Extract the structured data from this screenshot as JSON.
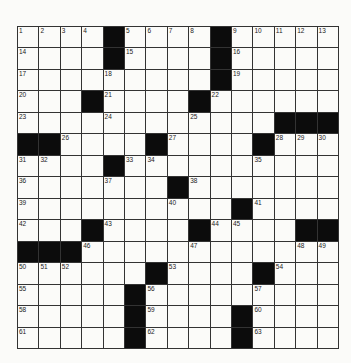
{
  "puzzle": {
    "rows": 15,
    "cols": 15,
    "colors": {
      "black": "#0c0c0c",
      "white": "#fbfbf9",
      "line": "#333333"
    },
    "layout": [
      "....#....#.....",
      "....#....#.....",
      ".........#.....",
      "...#....#......",
      "............###",
      "##....#....#...",
      "....#..........",
      ".......#.......",
      "..........#....",
      "...#....#....##",
      "###............",
      "......#....#...",
      ".....#.........",
      ".....#....#....",
      ".....#....#...."
    ],
    "numbers": [
      {
        "r": 0,
        "c": 0,
        "n": "1"
      },
      {
        "r": 0,
        "c": 1,
        "n": "2"
      },
      {
        "r": 0,
        "c": 2,
        "n": "3"
      },
      {
        "r": 0,
        "c": 3,
        "n": "4"
      },
      {
        "r": 0,
        "c": 5,
        "n": "5"
      },
      {
        "r": 0,
        "c": 6,
        "n": "6"
      },
      {
        "r": 0,
        "c": 7,
        "n": "7"
      },
      {
        "r": 0,
        "c": 8,
        "n": "8"
      },
      {
        "r": 0,
        "c": 10,
        "n": "9"
      },
      {
        "r": 0,
        "c": 11,
        "n": "10"
      },
      {
        "r": 0,
        "c": 12,
        "n": "11"
      },
      {
        "r": 0,
        "c": 13,
        "n": "12"
      },
      {
        "r": 0,
        "c": 14,
        "n": "13"
      },
      {
        "r": 1,
        "c": 0,
        "n": "14"
      },
      {
        "r": 1,
        "c": 5,
        "n": "15"
      },
      {
        "r": 1,
        "c": 10,
        "n": "16"
      },
      {
        "r": 2,
        "c": 0,
        "n": "17"
      },
      {
        "r": 2,
        "c": 4,
        "n": "18"
      },
      {
        "r": 2,
        "c": 10,
        "n": "19"
      },
      {
        "r": 3,
        "c": 0,
        "n": "20"
      },
      {
        "r": 3,
        "c": 4,
        "n": "21"
      },
      {
        "r": 3,
        "c": 9,
        "n": "22"
      },
      {
        "r": 4,
        "c": 0,
        "n": "23"
      },
      {
        "r": 4,
        "c": 4,
        "n": "24"
      },
      {
        "r": 4,
        "c": 8,
        "n": "25"
      },
      {
        "r": 5,
        "c": 2,
        "n": "26"
      },
      {
        "r": 5,
        "c": 7,
        "n": "27"
      },
      {
        "r": 5,
        "c": 12,
        "n": "28"
      },
      {
        "r": 5,
        "c": 13,
        "n": "29"
      },
      {
        "r": 5,
        "c": 14,
        "n": "30"
      },
      {
        "r": 6,
        "c": 0,
        "n": "31"
      },
      {
        "r": 6,
        "c": 1,
        "n": "32"
      },
      {
        "r": 6,
        "c": 5,
        "n": "33"
      },
      {
        "r": 6,
        "c": 6,
        "n": "34"
      },
      {
        "r": 6,
        "c": 11,
        "n": "35"
      },
      {
        "r": 7,
        "c": 0,
        "n": "36"
      },
      {
        "r": 7,
        "c": 4,
        "n": "37"
      },
      {
        "r": 7,
        "c": 8,
        "n": "38"
      },
      {
        "r": 8,
        "c": 0,
        "n": "39"
      },
      {
        "r": 8,
        "c": 7,
        "n": "40"
      },
      {
        "r": 8,
        "c": 11,
        "n": "41"
      },
      {
        "r": 9,
        "c": 0,
        "n": "42"
      },
      {
        "r": 9,
        "c": 4,
        "n": "43"
      },
      {
        "r": 9,
        "c": 9,
        "n": "44"
      },
      {
        "r": 9,
        "c": 10,
        "n": "45"
      },
      {
        "r": 10,
        "c": 3,
        "n": "46"
      },
      {
        "r": 10,
        "c": 8,
        "n": "47"
      },
      {
        "r": 10,
        "c": 13,
        "n": "48"
      },
      {
        "r": 10,
        "c": 14,
        "n": "49"
      },
      {
        "r": 11,
        "c": 0,
        "n": "50"
      },
      {
        "r": 11,
        "c": 1,
        "n": "51"
      },
      {
        "r": 11,
        "c": 2,
        "n": "52"
      },
      {
        "r": 11,
        "c": 7,
        "n": "53"
      },
      {
        "r": 11,
        "c": 12,
        "n": "54"
      },
      {
        "r": 12,
        "c": 0,
        "n": "55"
      },
      {
        "r": 12,
        "c": 6,
        "n": "56"
      },
      {
        "r": 12,
        "c": 11,
        "n": "57"
      },
      {
        "r": 13,
        "c": 0,
        "n": "58"
      },
      {
        "r": 13,
        "c": 6,
        "n": "59"
      },
      {
        "r": 13,
        "c": 11,
        "n": "60"
      },
      {
        "r": 14,
        "c": 0,
        "n": "61"
      },
      {
        "r": 14,
        "c": 6,
        "n": "62"
      },
      {
        "r": 14,
        "c": 11,
        "n": "63"
      }
    ]
  }
}
